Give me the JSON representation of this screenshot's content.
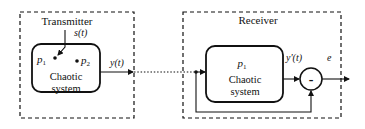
{
  "transmitter": {
    "title": "Transmitter",
    "input_signal": "s(t)",
    "param1": "p",
    "param1_sub": "1",
    "param2": "p",
    "param2_sub": "2",
    "block_line1": "Chaotic",
    "block_line2": "system",
    "output_signal": "y(t)"
  },
  "receiver": {
    "title": "Receiver",
    "param1": "p",
    "param1_sub": "1",
    "block_line1": "Chaotic",
    "block_line2": "system",
    "output_signal": "y'(t)",
    "summing_sign": "-",
    "error_signal": "e"
  },
  "colors": {
    "stroke": "#111111",
    "background": "#ffffff"
  }
}
